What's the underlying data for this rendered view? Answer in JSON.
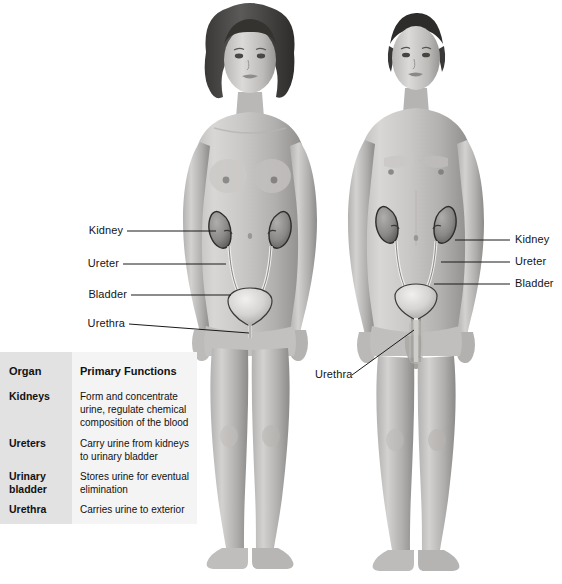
{
  "figure": {
    "type": "anatomical-illustration",
    "figures": [
      {
        "id": "female-figure",
        "sex": "female",
        "view": "anterior"
      },
      {
        "id": "male-figure",
        "sex": "male",
        "view": "anterior"
      }
    ]
  },
  "labels_left": [
    {
      "name": "kidney",
      "text": "Kidney"
    },
    {
      "name": "ureter",
      "text": "Ureter"
    },
    {
      "name": "bladder",
      "text": "Bladder"
    },
    {
      "name": "urethra",
      "text": "Urethra"
    }
  ],
  "labels_right": [
    {
      "name": "kidney",
      "text": "Kidney"
    },
    {
      "name": "ureter",
      "text": "Ureter"
    },
    {
      "name": "bladder",
      "text": "Bladder"
    },
    {
      "name": "urethra",
      "text": "Urethra"
    }
  ],
  "table": {
    "headers": {
      "organ": "Organ",
      "functions": "Primary Functions"
    },
    "rows": [
      {
        "organ": "Kidneys",
        "organ_line2": "",
        "function": "Form and concentrate urine, regulate chemical composition of the blood"
      },
      {
        "organ": "Ureters",
        "organ_line2": "",
        "function": "Carry urine from kidneys to urinary bladder"
      },
      {
        "organ": "Urinary",
        "organ_line2": "bladder",
        "function": "Stores urine for eventual elimination"
      },
      {
        "organ": "Urethra",
        "organ_line2": "",
        "function": "Carries urine to exterior"
      }
    ]
  },
  "colors": {
    "background": "#ffffff",
    "table_organ_column": "#e2e2e2",
    "table_function_column": "#f4f4f4",
    "text": "#141414",
    "skin_light": "#d8d6d4",
    "skin_mid": "#a9a7a5",
    "skin_dark": "#6f6d6b",
    "organ_outline": "#2a2a2a",
    "kidney_fill": "#8e8c8a",
    "bladder_fill": "#cfcdcb",
    "leader_line": "#1a1a1a"
  }
}
